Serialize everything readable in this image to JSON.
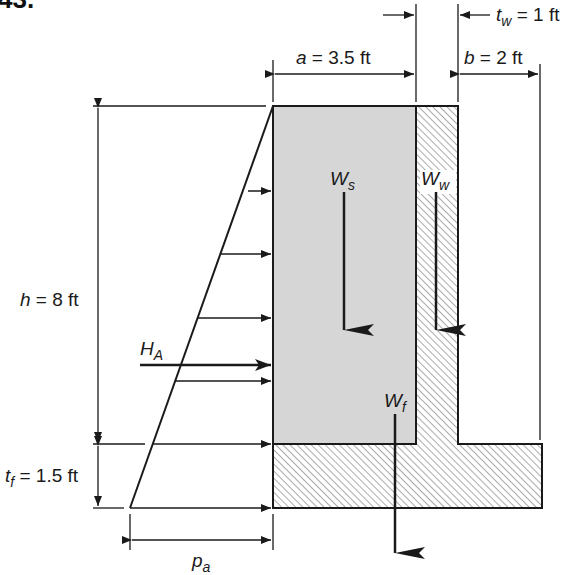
{
  "problem_number": "43.",
  "labels": {
    "a": {
      "var": "a",
      "eq": " = 3.5 ft"
    },
    "b": {
      "var": "b",
      "eq": " = 2 ft"
    },
    "tw": {
      "var": "t",
      "sub": "w",
      "eq": " = 1 ft"
    },
    "h": {
      "var": "h",
      "eq": " = 8 ft"
    },
    "tf": {
      "var": "t",
      "sub": "f",
      "eq": " = 1.5 ft"
    },
    "pa": {
      "var": "p",
      "sub": "a"
    },
    "HA": {
      "var": "H",
      "sub": "A"
    },
    "Ws": {
      "var": "W",
      "sub": "s"
    },
    "Ww": {
      "var": "W",
      "sub": "w"
    },
    "Wf": {
      "var": "W",
      "sub": "f"
    }
  },
  "dimensions": {
    "a_ft": 3.5,
    "b_ft": 2,
    "tw_ft": 1,
    "h_ft": 8,
    "tf_ft": 1.5
  },
  "colors": {
    "soil_fill": "#d6d6d6",
    "line": "#1a1a1a",
    "hatch": "#555555"
  }
}
